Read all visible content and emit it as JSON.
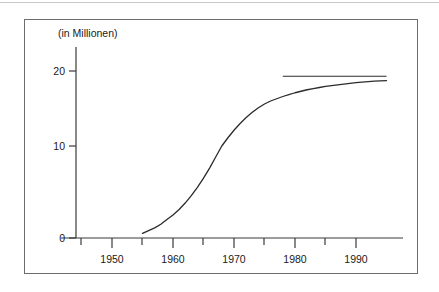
{
  "figure": {
    "frame_color": "#6d6d6d",
    "background": "#ffffff",
    "top_rule_color": "#c9c9c9"
  },
  "chart_data": {
    "type": "line",
    "title": "",
    "subtitle": "",
    "unit_label": "(in Millionen)",
    "xlabel": "",
    "ylabel": "",
    "xlim": [
      1943,
      1996
    ],
    "ylim": [
      0,
      22
    ],
    "grid": false,
    "legend": "none",
    "line_color": "#2b2b2b",
    "axis_color": "#3a3a3a",
    "x_tick_labels": [
      "1950",
      "1960",
      "1970",
      "1980",
      "1990"
    ],
    "x_major_ticks": [
      1950,
      1960,
      1970,
      1980,
      1990
    ],
    "x_minor_ticks": [
      1955,
      1965,
      1975,
      1985
    ],
    "y_tick_labels": [
      "0",
      "10",
      "20"
    ],
    "y_ticks": [
      0,
      10,
      20
    ],
    "x": [
      1955,
      1956,
      1957,
      1958,
      1959,
      1960,
      1961,
      1962,
      1963,
      1964,
      1965,
      1966,
      1967,
      1968,
      1969,
      1970,
      1971,
      1972,
      1973,
      1974,
      1975,
      1976,
      1977,
      1978,
      1979,
      1980,
      1981,
      1982,
      1983,
      1984,
      1985,
      1986,
      1987,
      1988,
      1989,
      1990,
      1991,
      1992,
      1993,
      1994,
      1995
    ],
    "values": [
      0.5,
      0.8,
      1.1,
      1.5,
      2.0,
      2.5,
      3.1,
      3.8,
      4.6,
      5.5,
      6.5,
      7.6,
      8.8,
      10.0,
      11.1,
      12.1,
      13.0,
      13.8,
      14.5,
      15.1,
      15.6,
      16.0,
      16.3,
      16.6,
      16.85,
      17.1,
      17.3,
      17.5,
      17.65,
      17.8,
      17.95,
      18.05,
      18.15,
      18.25,
      18.35,
      18.45,
      18.52,
      18.58,
      18.64,
      18.68,
      18.72
    ],
    "series": [
      {
        "name": "Bestand",
        "values": [
          0.5,
          0.8,
          1.1,
          1.5,
          2.0,
          2.5,
          3.1,
          3.8,
          4.6,
          5.5,
          6.5,
          7.6,
          8.8,
          10.0,
          11.1,
          12.1,
          13.0,
          13.8,
          14.5,
          15.1,
          15.6,
          16.0,
          16.3,
          16.6,
          16.85,
          17.1,
          17.3,
          17.5,
          17.65,
          17.8,
          17.95,
          18.05,
          18.15,
          18.25,
          18.35,
          18.45,
          18.52,
          18.58,
          18.64,
          18.68,
          18.72
        ]
      }
    ],
    "annotations": [
      {
        "name": "reference-line",
        "type": "hline",
        "y": 19.3,
        "x_start": 1978,
        "x_end": 1995,
        "color": "#2b2b2b"
      }
    ]
  }
}
